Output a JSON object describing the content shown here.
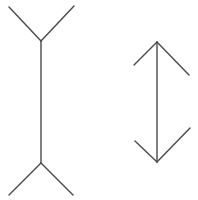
{
  "diagram": {
    "title": "Müller-Lyer illusion",
    "stroke_color": "#4a4a4a",
    "background": "#ffffff",
    "figures": [
      {
        "id": "fins-out",
        "label": "Line with outward-pointing fins",
        "shaft": {
          "x1": 41,
          "y1": 41,
          "x2": 41,
          "y2": 163
        },
        "fins": [
          {
            "x1": 9,
            "y1": 7,
            "x2": 41,
            "y2": 41
          },
          {
            "x1": 74,
            "y1": 6,
            "x2": 41,
            "y2": 41
          },
          {
            "x1": 41,
            "y1": 163,
            "x2": 9,
            "y2": 195
          },
          {
            "x1": 41,
            "y1": 163,
            "x2": 73,
            "y2": 195
          }
        ]
      },
      {
        "id": "arrowheads",
        "label": "Line with inward-pointing arrowheads",
        "shaft": {
          "x1": 157,
          "y1": 42,
          "x2": 157,
          "y2": 162
        },
        "fins": [
          {
            "x1": 157,
            "y1": 42,
            "x2": 134,
            "y2": 65
          },
          {
            "x1": 157,
            "y1": 42,
            "x2": 189,
            "y2": 75
          },
          {
            "x1": 135,
            "y1": 141,
            "x2": 157,
            "y2": 162
          },
          {
            "x1": 190,
            "y1": 128,
            "x2": 157,
            "y2": 162
          }
        ]
      }
    ]
  }
}
